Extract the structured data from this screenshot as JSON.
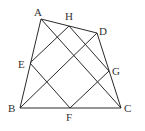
{
  "diagram": {
    "type": "geometry",
    "points": [
      {
        "id": "A",
        "label": "A",
        "x": 41,
        "y": 19,
        "lx": 34,
        "ly": 16
      },
      {
        "id": "H",
        "label": "H",
        "x": 69,
        "y": 26,
        "lx": 65,
        "ly": 20
      },
      {
        "id": "D",
        "label": "D",
        "x": 97,
        "y": 33,
        "lx": 99,
        "ly": 35
      },
      {
        "id": "E",
        "label": "E",
        "x": 30,
        "y": 63,
        "lx": 18,
        "ly": 68
      },
      {
        "id": "G",
        "label": "G",
        "x": 109,
        "y": 71,
        "lx": 112,
        "ly": 75
      },
      {
        "id": "B",
        "label": "B",
        "x": 20,
        "y": 108,
        "lx": 8,
        "ly": 112
      },
      {
        "id": "F",
        "label": "F",
        "x": 70,
        "y": 108,
        "lx": 66,
        "ly": 121
      },
      {
        "id": "C",
        "label": "C",
        "x": 121,
        "y": 108,
        "lx": 124,
        "ly": 112
      }
    ],
    "segments": [
      {
        "name": "side-AB",
        "from": "A",
        "to": "B"
      },
      {
        "name": "side-BC",
        "from": "B",
        "to": "C"
      },
      {
        "name": "side-CD",
        "from": "C",
        "to": "D"
      },
      {
        "name": "side-DA",
        "from": "D",
        "to": "A"
      },
      {
        "name": "diagonal-AC",
        "from": "A",
        "to": "C"
      },
      {
        "name": "diagonal-BD",
        "from": "B",
        "to": "D"
      },
      {
        "name": "segment-EH",
        "from": "E",
        "to": "H"
      },
      {
        "name": "segment-HG",
        "from": "H",
        "to": "G"
      },
      {
        "name": "segment-GF",
        "from": "G",
        "to": "F"
      },
      {
        "name": "segment-FE",
        "from": "F",
        "to": "E"
      }
    ],
    "stroke_color": "#2a2a2a",
    "label_color": "#333333"
  }
}
